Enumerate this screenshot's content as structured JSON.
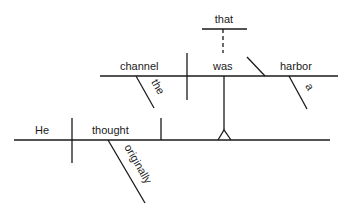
{
  "diagram": {
    "type": "sentence-diagram",
    "sentence_words": {
      "subject": "He",
      "verb": "thought",
      "verb_modifier": "originally",
      "clause_subject": "channel",
      "clause_subject_modifier": "the",
      "clause_verb": "was",
      "clause_complement": "harbor",
      "clause_complement_modifier": "a",
      "connector": "that"
    },
    "colors": {
      "line": "#1a1a1a",
      "background": "#ffffff"
    }
  }
}
